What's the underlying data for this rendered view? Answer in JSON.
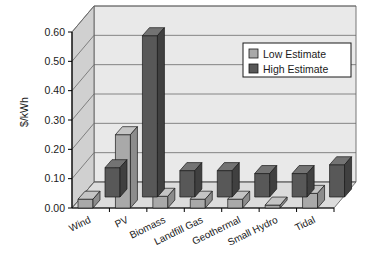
{
  "chart_data": {
    "type": "bar",
    "title": "",
    "xlabel": "",
    "ylabel": "$/kWh",
    "ylim": [
      0.0,
      0.6
    ],
    "yticks": [
      "0.00",
      "0.10",
      "0.20",
      "0.30",
      "0.40",
      "0.50",
      "0.60"
    ],
    "ytick_values": [
      0.0,
      0.1,
      0.2,
      0.3,
      0.4,
      0.5,
      0.6
    ],
    "grid": true,
    "three_d": true,
    "legend_position": "top-right",
    "categories": [
      "Wind",
      "PV",
      "Biomass",
      "Landfill Gas",
      "Geothermal",
      "Small Hydro",
      "Tidal"
    ],
    "series": [
      {
        "name": "Low Estimate",
        "color": "#a9a9a9",
        "values": [
          0.03,
          0.25,
          0.04,
          0.03,
          0.03,
          0.01,
          0.05
        ]
      },
      {
        "name": "High Estimate",
        "color": "#585858",
        "values": [
          0.1,
          0.55,
          0.09,
          0.09,
          0.08,
          0.08,
          0.11
        ]
      }
    ]
  },
  "legend": {
    "items": [
      {
        "label": "Low Estimate",
        "swatch": "#a9a9a9"
      },
      {
        "label": "High Estimate",
        "swatch": "#585858"
      }
    ]
  },
  "colors": {
    "wall_back": "#e9e9e9",
    "wall_side": "#d0d0d0",
    "floor": "#dcdcdc",
    "gridline": "#6a6a6a",
    "axis": "#000000",
    "low_front": "#a9a9a9",
    "low_top": "#c4c4c4",
    "low_side": "#8c8c8c",
    "high_front": "#585858",
    "high_top": "#737373",
    "high_side": "#404040",
    "text": "#1a1a1a"
  },
  "axis": {
    "ylabel": "$/kWh",
    "ticks": [
      "0.00",
      "0.10",
      "0.20",
      "0.30",
      "0.40",
      "0.50",
      "0.60"
    ]
  }
}
